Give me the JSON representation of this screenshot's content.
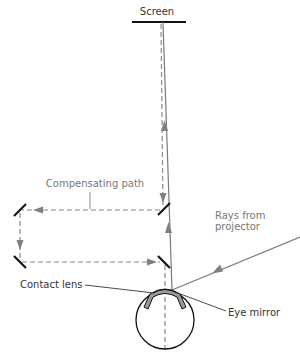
{
  "diagram": {
    "labels": {
      "screen": "Screen",
      "compensating_path": "Compensating path",
      "rays_from_projector_line1": "Rays from",
      "rays_from_projector_line2": "projector",
      "contact_lens": "Contact lens",
      "eye_mirror": "Eye mirror"
    },
    "components": [
      {
        "id": "screen",
        "label": "Screen"
      },
      {
        "id": "compensating-path",
        "label": "Compensating path",
        "mirrors": 4
      },
      {
        "id": "projector-rays",
        "label": "Rays from projector"
      },
      {
        "id": "contact-lens",
        "label": "Contact lens"
      },
      {
        "id": "eye-mirror",
        "label": "Eye mirror"
      },
      {
        "id": "eye",
        "label": ""
      }
    ],
    "colors": {
      "ray": "#7a7a7a",
      "dashed_path": "#8a8a8a",
      "mirror": "#111111",
      "lens_fill": "#9a9a9a",
      "text": "#333333",
      "text_gray": "#777777"
    }
  }
}
